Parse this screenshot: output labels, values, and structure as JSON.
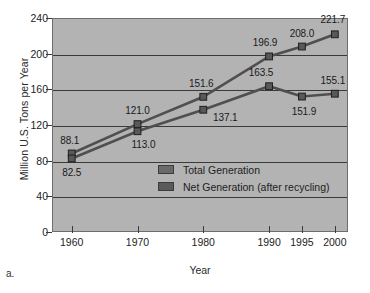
{
  "figure": {
    "caption": "a."
  },
  "chart_data": {
    "type": "line",
    "title": "",
    "xlabel": "Year",
    "ylabel": "Million U.S. Tons per Year",
    "categories": [
      "1960",
      "1970",
      "1980",
      "1990",
      "1995",
      "2000"
    ],
    "x": [
      1960,
      1970,
      1980,
      1990,
      1995,
      2000
    ],
    "xlim": [
      1957,
      2002
    ],
    "ylim": [
      0,
      240
    ],
    "yticks": [
      0,
      40,
      80,
      120,
      160,
      200,
      240
    ],
    "xticks": [
      "1960",
      "1970",
      "1980",
      "1990",
      "1995",
      "2000"
    ],
    "grid": true,
    "legend_position": "center",
    "series": [
      {
        "name": "Total Generation",
        "color": "#6a6a6a",
        "values": [
          88.1,
          121.0,
          151.6,
          196.9,
          208.0,
          221.7
        ],
        "labels": [
          "88.1",
          "121.0",
          "151.6",
          "196.9",
          "208.0",
          "221.7"
        ]
      },
      {
        "name": "Net Generation (after recycling)",
        "color": "#5a5a5a",
        "values": [
          82.5,
          113.0,
          137.1,
          163.5,
          151.9,
          155.1
        ],
        "labels": [
          "82.5",
          "113.0",
          "137.1",
          "163.5",
          "151.9",
          "155.1"
        ]
      }
    ],
    "colors": {
      "plot_background": "#b3b3b3",
      "axis": "#3a3a3a",
      "line": "#555555",
      "text": "#1d1d1d"
    }
  }
}
